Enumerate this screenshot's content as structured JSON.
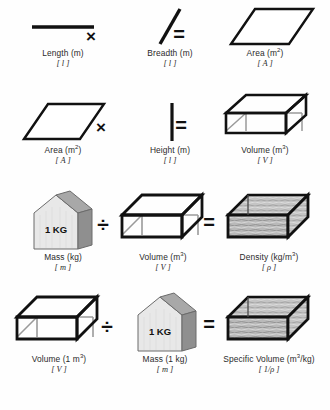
{
  "diagram": {
    "colors": {
      "ink": "#111111",
      "line_gray": "#9a9a9a",
      "block_light": "#e8e8e8",
      "block_mid": "#c9c9c9",
      "block_dark": "#8f8f8f",
      "fluid_gray": "#b3b3b3",
      "background": "#ffffff"
    },
    "rows": [
      {
        "id": "row-length-breadth-area",
        "operands": [
          {
            "id": "length",
            "icon": "horizontal-line-icon",
            "label": "Length (m)",
            "symbol": "[ l ]"
          },
          {
            "id": "breadth",
            "icon": "diagonal-line-icon",
            "label": "Breadth (m)",
            "symbol": "[ l ]"
          }
        ],
        "result": {
          "id": "area",
          "icon": "parallelogram-icon",
          "label_text": "Area (m",
          "label_sup": "2",
          "label_tail": ")",
          "symbol": "[ A ]"
        },
        "operator": "×",
        "equals": "="
      },
      {
        "id": "row-area-height-volume",
        "operands": [
          {
            "id": "area-2",
            "icon": "parallelogram-icon",
            "label_text": "Area (m",
            "label_sup": "2",
            "label_tail": ")",
            "symbol": "[ A ]"
          },
          {
            "id": "height",
            "icon": "vertical-line-icon",
            "label": "Height (m)",
            "symbol": "[ l ]"
          }
        ],
        "result": {
          "id": "volume",
          "icon": "wireframe-box-icon",
          "label_text": "Volume (m",
          "label_sup": "3",
          "label_tail": ")",
          "symbol": "[ V ]"
        },
        "operator": "×",
        "equals": "="
      },
      {
        "id": "row-mass-volume-density",
        "operands": [
          {
            "id": "mass",
            "icon": "kg-block-icon",
            "block_text": "1 KG",
            "label": "Mass (kg)",
            "symbol": "[ m ]"
          },
          {
            "id": "volume-2",
            "icon": "wireframe-box-icon",
            "label_text": "Volume (m",
            "label_sup": "3",
            "label_tail": ")",
            "symbol": "[ V ]"
          }
        ],
        "result": {
          "id": "density",
          "icon": "filled-box-icon",
          "label_text": "Density (kg/m",
          "label_sup": "3",
          "label_tail": ")",
          "symbol": "[ ρ ]"
        },
        "operator": "÷",
        "equals": "="
      },
      {
        "id": "row-volume-mass-specific-volume",
        "operands": [
          {
            "id": "volume-3",
            "icon": "wireframe-box-icon",
            "label_text": "Volume (1 m",
            "label_sup": "3",
            "label_tail": ")",
            "symbol": "[ V ]"
          },
          {
            "id": "mass-2",
            "icon": "kg-block-icon",
            "block_text": "1 KG",
            "label": "Mass (1 kg)",
            "symbol": "[ m ]"
          }
        ],
        "result": {
          "id": "specific-volume",
          "icon": "filled-box-icon",
          "label_text": "Specific Volume (m",
          "label_sup": "3",
          "label_tail": "/kg)",
          "symbol": "[ 1/ρ ]"
        },
        "operator": "÷",
        "equals": "="
      }
    ]
  }
}
